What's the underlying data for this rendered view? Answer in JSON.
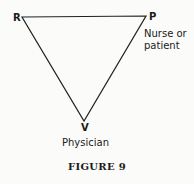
{
  "diagram": {
    "vertices": {
      "top_left": {
        "label": "R"
      },
      "top_right": {
        "label": "P",
        "description_line1": "Nurse or",
        "description_line2": "patient"
      },
      "bottom": {
        "label": "V",
        "description": "Physician"
      }
    },
    "caption": "FIGURE 9",
    "line_color": "#222222"
  }
}
